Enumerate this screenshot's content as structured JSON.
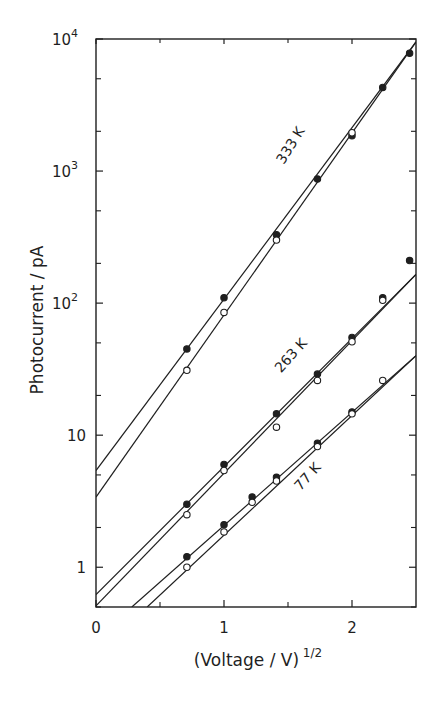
{
  "chart_data": {
    "type": "scatter",
    "title": "",
    "xlabel": "(Voltage / V)",
    "xlabel_sup": "1/2",
    "ylabel": "Photocurrent / pA",
    "xlim": [
      0,
      2.5
    ],
    "ylim": [
      0.5,
      10000
    ],
    "yscale": "log",
    "x_ticks": [
      {
        "v": 0,
        "label": "0"
      },
      {
        "v": 1,
        "label": "1"
      },
      {
        "v": 2,
        "label": "2"
      }
    ],
    "x_minor_ticks": [
      0.5,
      1.5
    ],
    "y_ticks": [
      {
        "v": 1,
        "label": "1",
        "sup": ""
      },
      {
        "v": 10,
        "label": "10",
        "sup": ""
      },
      {
        "v": 100,
        "label": "10",
        "sup": "2"
      },
      {
        "v": 1000,
        "label": "10",
        "sup": "3"
      },
      {
        "v": 10000,
        "label": "10",
        "sup": "4"
      }
    ],
    "y_minor_ticks": [
      0.5,
      2,
      5,
      20,
      50,
      200,
      500,
      2000,
      5000
    ],
    "grid": false,
    "legend": "none (series labelled inline)",
    "series": [
      {
        "name": "333 K (filled)",
        "temperature": "333 K",
        "marker": "filled",
        "x": [
          0.71,
          1.0,
          1.41,
          1.73,
          2.0,
          2.24,
          2.45
        ],
        "y": [
          45,
          110,
          330,
          870,
          1850,
          4300,
          7800
        ],
        "fit": {
          "x0": 0,
          "y0": 5.4,
          "x1": 2.5,
          "y1": 9500
        }
      },
      {
        "name": "333 K (open)",
        "temperature": "333 K",
        "marker": "open",
        "x": [
          0.71,
          1.0,
          1.41,
          2.0
        ],
        "y": [
          31,
          85,
          300,
          1950
        ],
        "fit": {
          "x0": 0,
          "y0": 3.4,
          "x1": 2.5,
          "y1": 9500
        }
      },
      {
        "name": "263 K (filled)",
        "temperature": "263 K",
        "marker": "filled",
        "x": [
          0.71,
          1.0,
          1.41,
          1.73,
          2.0,
          2.24,
          2.45
        ],
        "y": [
          3.0,
          6.0,
          14.5,
          29,
          55,
          110,
          210
        ],
        "fit": {
          "x0": 0,
          "y0": 0.62,
          "x1": 2.5,
          "y1": 165
        }
      },
      {
        "name": "263 K (open)",
        "temperature": "263 K",
        "marker": "open",
        "x": [
          0.71,
          1.0,
          1.41,
          1.73,
          2.0,
          2.24
        ],
        "y": [
          2.5,
          5.4,
          11.5,
          26,
          51,
          105
        ],
        "fit": {
          "x0": 0,
          "y0": 0.51,
          "x1": 2.5,
          "y1": 165
        }
      },
      {
        "name": "77 K (filled)",
        "temperature": "77 K",
        "marker": "filled",
        "x": [
          0.71,
          1.0,
          1.22,
          1.41,
          1.73,
          2.0
        ],
        "y": [
          1.2,
          2.1,
          3.4,
          4.8,
          8.7,
          15
        ],
        "fit": {
          "x0": 0.28,
          "y0": 0.5,
          "x1": 2.5,
          "y1": 40
        }
      },
      {
        "name": "77 K (open)",
        "temperature": "77 K",
        "marker": "open",
        "x": [
          0.71,
          1.0,
          1.22,
          1.41,
          1.73,
          2.0,
          2.24
        ],
        "y": [
          1.0,
          1.85,
          3.1,
          4.5,
          8.2,
          14.5,
          26
        ],
        "fit": {
          "x0": 0.4,
          "y0": 0.5,
          "x1": 2.5,
          "y1": 40
        }
      }
    ],
    "annotations": [
      {
        "text": "333 K",
        "x": 1.55,
        "y": 1500,
        "rotation": -58
      },
      {
        "text": "263 K",
        "x": 1.55,
        "y": 38,
        "rotation": -48
      },
      {
        "text": "77 K",
        "x": 1.68,
        "y": 4.6,
        "rotation": -48
      }
    ]
  },
  "colors": {
    "ink": "#1f1f1f",
    "background": "#ffffff"
  }
}
